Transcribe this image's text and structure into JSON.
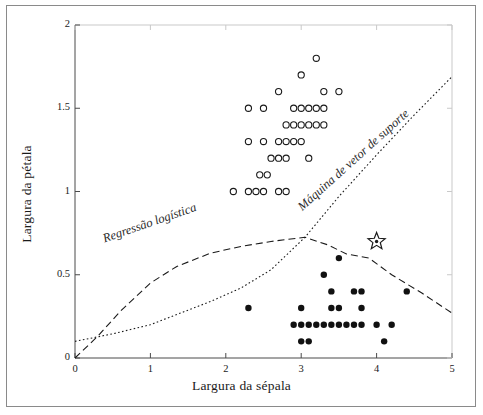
{
  "chart_data": {
    "type": "scatter",
    "title": "",
    "xlabel": "Largura da sépala",
    "ylabel": "Largura da pétala",
    "xlim": [
      0,
      5
    ],
    "ylim": [
      0,
      2
    ],
    "xticks": [
      "0",
      "1",
      "2",
      "3",
      "4",
      "5"
    ],
    "xtick_values": [
      0,
      1,
      2,
      3,
      4,
      5
    ],
    "yticks": [
      "0",
      "0.5",
      "1",
      "1.5",
      "2"
    ],
    "ytick_values": [
      0,
      0.5,
      1,
      1.5,
      2
    ],
    "grid": false,
    "legend_position": "inline-annotations",
    "series": [
      {
        "name": "Iris virginica",
        "marker": "open-circle",
        "color": "#1a1a1a",
        "points": [
          [
            3.2,
            1.8
          ],
          [
            3.0,
            1.7
          ],
          [
            2.7,
            1.6
          ],
          [
            3.3,
            1.6
          ],
          [
            3.5,
            1.6
          ],
          [
            2.3,
            1.5
          ],
          [
            2.5,
            1.5
          ],
          [
            2.9,
            1.5
          ],
          [
            3.0,
            1.5
          ],
          [
            3.1,
            1.5
          ],
          [
            3.2,
            1.5
          ],
          [
            3.3,
            1.5
          ],
          [
            2.8,
            1.4
          ],
          [
            2.9,
            1.4
          ],
          [
            3.0,
            1.4
          ],
          [
            3.1,
            1.4
          ],
          [
            3.2,
            1.4
          ],
          [
            3.3,
            1.4
          ],
          [
            2.3,
            1.3
          ],
          [
            2.5,
            1.3
          ],
          [
            2.7,
            1.3
          ],
          [
            2.8,
            1.3
          ],
          [
            2.9,
            1.3
          ],
          [
            3.0,
            1.3
          ],
          [
            2.6,
            1.2
          ],
          [
            2.7,
            1.2
          ],
          [
            2.8,
            1.2
          ],
          [
            3.1,
            1.2
          ],
          [
            2.45,
            1.1
          ],
          [
            2.55,
            1.1
          ],
          [
            2.1,
            1.0
          ],
          [
            2.3,
            1.0
          ],
          [
            2.4,
            1.0
          ],
          [
            2.5,
            1.0
          ],
          [
            2.7,
            1.0
          ],
          [
            2.8,
            1.0
          ]
        ]
      },
      {
        "name": "Outras",
        "marker": "filled-circle",
        "color": "#111111",
        "points": [
          [
            3.5,
            0.6
          ],
          [
            3.3,
            0.5
          ],
          [
            3.4,
            0.4
          ],
          [
            3.7,
            0.4
          ],
          [
            3.8,
            0.4
          ],
          [
            4.4,
            0.4
          ],
          [
            2.3,
            0.3
          ],
          [
            3.0,
            0.3
          ],
          [
            3.4,
            0.3
          ],
          [
            3.5,
            0.3
          ],
          [
            3.8,
            0.3
          ],
          [
            2.9,
            0.2
          ],
          [
            3.0,
            0.2
          ],
          [
            3.1,
            0.2
          ],
          [
            3.2,
            0.2
          ],
          [
            3.3,
            0.2
          ],
          [
            3.4,
            0.2
          ],
          [
            3.5,
            0.2
          ],
          [
            3.6,
            0.2
          ],
          [
            3.7,
            0.2
          ],
          [
            3.8,
            0.2
          ],
          [
            4.0,
            0.2
          ],
          [
            4.2,
            0.2
          ],
          [
            3.0,
            0.1
          ],
          [
            3.1,
            0.1
          ],
          [
            4.1,
            0.1
          ]
        ]
      },
      {
        "name": "Instância destacada",
        "marker": "star",
        "color": "#1a1a1a",
        "points": [
          [
            4.0,
            0.7
          ]
        ]
      }
    ],
    "annotations": [
      {
        "id": "logistic-regression",
        "text": "Regressão logística",
        "style": "italic",
        "rotation": -19
      },
      {
        "id": "support-vector-machine",
        "text": "Máquina de vetor de suporte",
        "style": "italic",
        "rotation": -42
      }
    ],
    "decision_boundaries": [
      {
        "name": "Regressão logística",
        "line_style": "dashed",
        "color": "#1a1a1a",
        "points": [
          [
            0.0,
            0.0
          ],
          [
            0.3,
            0.13
          ],
          [
            0.6,
            0.28
          ],
          [
            1.0,
            0.45
          ],
          [
            1.35,
            0.55
          ],
          [
            1.8,
            0.63
          ],
          [
            2.2,
            0.67
          ],
          [
            2.6,
            0.7
          ],
          [
            3.05,
            0.725
          ],
          [
            3.35,
            0.68
          ],
          [
            3.6,
            0.625
          ],
          [
            3.9,
            0.6
          ],
          [
            4.2,
            0.5
          ],
          [
            4.6,
            0.39
          ],
          [
            5.0,
            0.27
          ]
        ]
      },
      {
        "name": "Máquina de vetor de suporte",
        "line_style": "dotted",
        "color": "#1a1a1a",
        "points": [
          [
            0.0,
            0.1
          ],
          [
            0.5,
            0.145
          ],
          [
            1.0,
            0.2
          ],
          [
            1.4,
            0.27
          ],
          [
            1.8,
            0.34
          ],
          [
            2.2,
            0.42
          ],
          [
            2.6,
            0.53
          ],
          [
            3.05,
            0.725
          ],
          [
            3.5,
            0.97
          ],
          [
            4.0,
            1.22
          ],
          [
            4.5,
            1.46
          ],
          [
            5.0,
            1.69
          ]
        ]
      }
    ]
  },
  "frame": {
    "border_color": "#8a8a8a",
    "background": "#ffffff"
  }
}
